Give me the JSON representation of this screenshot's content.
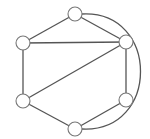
{
  "diagram": {
    "type": "undirected-graph",
    "node_radius": 7,
    "colors": {
      "edge": "#555555",
      "node_stroke": "#777777",
      "node_fill": "#ffffff",
      "background": "#ffffff"
    },
    "nodes": [
      {
        "id": "top",
        "x": 75,
        "y": 14,
        "label": ""
      },
      {
        "id": "left-upper",
        "x": 23,
        "y": 43,
        "label": ""
      },
      {
        "id": "right-upper",
        "x": 126,
        "y": 42,
        "label": ""
      },
      {
        "id": "left-lower",
        "x": 23,
        "y": 101,
        "label": ""
      },
      {
        "id": "right-lower",
        "x": 126,
        "y": 100,
        "label": ""
      },
      {
        "id": "bottom",
        "x": 75,
        "y": 129,
        "label": ""
      }
    ],
    "edges": [
      {
        "from": "top",
        "to": "left-upper",
        "shape": "line"
      },
      {
        "from": "top",
        "to": "right-upper",
        "shape": "line"
      },
      {
        "from": "left-upper",
        "to": "right-upper",
        "shape": "line"
      },
      {
        "from": "left-upper",
        "to": "left-lower",
        "shape": "line"
      },
      {
        "from": "right-upper",
        "to": "left-lower",
        "shape": "line"
      },
      {
        "from": "right-upper",
        "to": "right-lower",
        "shape": "line"
      },
      {
        "from": "left-lower",
        "to": "bottom",
        "shape": "line"
      },
      {
        "from": "right-lower",
        "to": "bottom",
        "shape": "line"
      },
      {
        "from": "top",
        "to": "bottom",
        "shape": "curve-right"
      }
    ]
  }
}
